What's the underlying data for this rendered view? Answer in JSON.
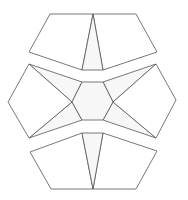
{
  "diagram": {
    "colors": {
      "stroke": "#555555",
      "face": "#ffffff",
      "inner": "#f7f7f7",
      "background": "#ffffff"
    },
    "pieces": {
      "top": {
        "left_pentagon": "50,14 93,14 82,70 29,52",
        "triangle": "93,14 103,70 82,70",
        "right_pentagon": "93,14 136,14 157,52 103,70"
      },
      "middle": {
        "hexagon": "82,82 103,82 113,102 103,120 82,120 72,102",
        "left_pentagon": "29,64 8,102 29,138 72,102",
        "right_pentagon": "156,64 176,100 156,138 113,102",
        "upper_left_tri": "29,64 82,82 72,102",
        "upper_right_tri": "156,64 103,82 113,102",
        "lower_left_tri": "29,138 82,120 72,102",
        "lower_right_tri": "156,138 103,120 113,102",
        "upper_band_top_left": "29,64 82,82",
        "upper_band_top_right": "103,82 156,64"
      },
      "bottom": {
        "left_pentagon": "82,133 93,189 51,189 30,152",
        "triangle": "82,133 103,133 93,189",
        "right_pentagon": "103,133 157,151 136,189 93,189"
      }
    }
  }
}
